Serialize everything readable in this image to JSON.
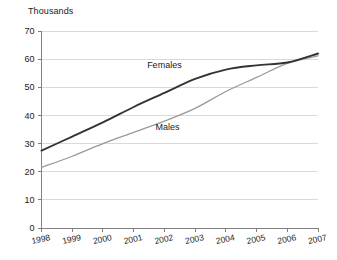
{
  "chart_data": {
    "type": "line",
    "title": "Thousands",
    "xlabel": "",
    "ylabel": "Thousands",
    "ylim": [
      0,
      70
    ],
    "ytick_step": 10,
    "yticks": [
      "0",
      "10",
      "20",
      "30",
      "40",
      "50",
      "60",
      "70"
    ],
    "categories": [
      "1998",
      "1999",
      "2000",
      "2001",
      "2002",
      "2003",
      "2004",
      "2005",
      "2006",
      "2007"
    ],
    "x": [
      1998,
      1999,
      2000,
      2001,
      2002,
      2003,
      2004,
      2005,
      2006,
      2007
    ],
    "grid": "horizontal",
    "legend_position": "inline-annotation",
    "series": [
      {
        "name": "Females",
        "color": "#333333",
        "width": 1.9,
        "values": [
          27.5,
          32.5,
          37.5,
          43.0,
          48.0,
          53.0,
          56.3,
          57.8,
          58.8,
          62.0
        ],
        "label_x": 2002.0,
        "label_y": 57.0
      },
      {
        "name": "Males",
        "color": "#999999",
        "width": 1.3,
        "values": [
          21.5,
          25.5,
          30.0,
          34.0,
          38.0,
          42.5,
          48.5,
          53.5,
          58.5,
          61.2
        ],
        "label_x": 2002.1,
        "label_y": 35.0
      }
    ],
    "annotations": [
      {
        "text": "Females",
        "x": 2002.0,
        "y": 57.0
      },
      {
        "text": "Males",
        "x": 2002.1,
        "y": 35.0
      }
    ],
    "axis_color": "#808080",
    "gridline_color": "#d9d9d9",
    "background": "#ffffff"
  }
}
